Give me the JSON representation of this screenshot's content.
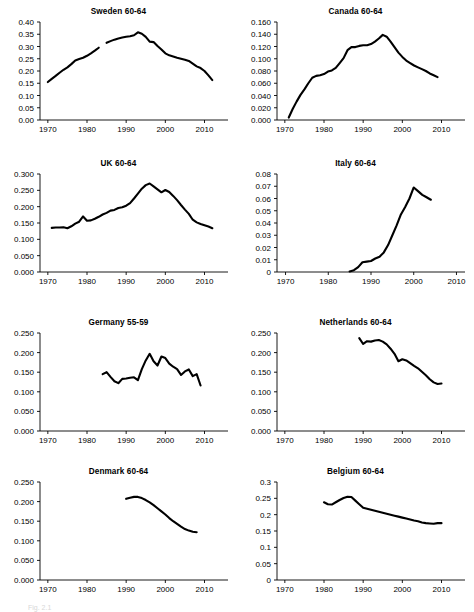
{
  "figure": {
    "title_hidden": "",
    "caption_fragment": "Fig. 2.1",
    "rows": 4,
    "cols": 2,
    "line_color": "#000000",
    "background": "#ffffff"
  },
  "chart_data": [
    {
      "type": "line",
      "title": "Sweden 60-64",
      "xlabel": "",
      "ylabel": "",
      "xlim": [
        1968,
        2016
      ],
      "ylim": [
        0.0,
        0.4
      ],
      "xticks": [
        1970,
        1980,
        1990,
        2000,
        2010
      ],
      "xtick_labels": [
        "1970",
        "1980",
        "1990",
        "2000",
        "2010"
      ],
      "yticks": [
        0.0,
        0.05,
        0.1,
        0.15,
        0.2,
        0.25,
        0.3,
        0.35,
        0.4
      ],
      "ytick_labels": [
        "0.00",
        "0.05",
        "0.10",
        "0.15",
        "0.20",
        "0.25",
        "0.30",
        "0.35",
        "0.40"
      ],
      "grid": false,
      "legend": "none",
      "segments": [
        {
          "x": [
            1970,
            1971,
            1972,
            1973,
            1974,
            1975,
            1976,
            1977,
            1978,
            1979,
            1980,
            1981,
            1982,
            1983
          ],
          "y": [
            0.155,
            0.168,
            0.18,
            0.193,
            0.205,
            0.215,
            0.228,
            0.243,
            0.249,
            0.254,
            0.262,
            0.272,
            0.283,
            0.295
          ]
        },
        {
          "x": [
            1985,
            1986,
            1987,
            1988,
            1989,
            1990,
            1991,
            1992,
            1993,
            1994,
            1995,
            1996,
            1997,
            1998,
            1999,
            2000,
            2001,
            2002,
            2003,
            2004,
            2005,
            2006,
            2007,
            2008,
            2009,
            2010,
            2011,
            2012
          ],
          "y": [
            0.315,
            0.322,
            0.328,
            0.333,
            0.337,
            0.34,
            0.342,
            0.346,
            0.358,
            0.352,
            0.339,
            0.32,
            0.318,
            0.302,
            0.288,
            0.272,
            0.264,
            0.259,
            0.254,
            0.25,
            0.246,
            0.241,
            0.23,
            0.219,
            0.212,
            0.2,
            0.182,
            0.163
          ]
        }
      ]
    },
    {
      "type": "line",
      "title": "Canada 60-64",
      "xlabel": "",
      "ylabel": "",
      "xlim": [
        1968,
        2016
      ],
      "ylim": [
        0.0,
        0.16
      ],
      "xticks": [
        1970,
        1980,
        1990,
        2000,
        2010
      ],
      "xtick_labels": [
        "1970",
        "1980",
        "1990",
        "2000",
        "2010"
      ],
      "yticks": [
        0.0,
        0.02,
        0.04,
        0.06,
        0.08,
        0.1,
        0.12,
        0.14,
        0.16
      ],
      "ytick_labels": [
        "0.000",
        "0.020",
        "0.040",
        "0.060",
        "0.080",
        "0.100",
        "0.120",
        "0.140",
        "0.160"
      ],
      "grid": false,
      "legend": "none",
      "segments": [
        {
          "x": [
            1971,
            1972,
            1973,
            1974,
            1975,
            1976,
            1977,
            1978,
            1979,
            1980,
            1981,
            1982,
            1983,
            1984,
            1985,
            1986,
            1987,
            1988,
            1989,
            1990,
            1991,
            1992,
            1993,
            1994,
            1995,
            1996,
            1997,
            1998,
            1999,
            2000,
            2001,
            2002,
            2003,
            2004,
            2005,
            2006,
            2007,
            2008,
            2009
          ],
          "y": [
            0.004,
            0.018,
            0.03,
            0.041,
            0.05,
            0.06,
            0.069,
            0.072,
            0.073,
            0.075,
            0.079,
            0.081,
            0.085,
            0.093,
            0.101,
            0.114,
            0.119,
            0.119,
            0.121,
            0.122,
            0.122,
            0.124,
            0.128,
            0.133,
            0.139,
            0.136,
            0.128,
            0.119,
            0.11,
            0.103,
            0.097,
            0.093,
            0.089,
            0.086,
            0.083,
            0.08,
            0.076,
            0.073,
            0.07
          ]
        }
      ]
    },
    {
      "type": "line",
      "title": "UK 60-64",
      "xlabel": "",
      "ylabel": "",
      "xlim": [
        1968,
        2016
      ],
      "ylim": [
        0.0,
        0.3
      ],
      "xticks": [
        1970,
        1980,
        1990,
        2000,
        2010
      ],
      "xtick_labels": [
        "1970",
        "1980",
        "1990",
        "2000",
        "2010"
      ],
      "yticks": [
        0.0,
        0.05,
        0.1,
        0.15,
        0.2,
        0.25,
        0.3
      ],
      "ytick_labels": [
        "0.000",
        "0.050",
        "0.100",
        "0.150",
        "0.200",
        "0.250",
        "0.300"
      ],
      "grid": false,
      "legend": "none",
      "segments": [
        {
          "x": [
            1971,
            1972,
            1973,
            1974,
            1975,
            1976,
            1977,
            1978,
            1979,
            1980,
            1981,
            1982,
            1983,
            1984,
            1985,
            1986,
            1987,
            1988,
            1989,
            1990,
            1991,
            1992,
            1993,
            1994,
            1995,
            1996,
            1997,
            1998,
            1999,
            2000,
            2001,
            2002,
            2003,
            2004,
            2005,
            2006,
            2007,
            2008,
            2009,
            2010,
            2011,
            2012
          ],
          "y": [
            0.135,
            0.136,
            0.136,
            0.137,
            0.134,
            0.14,
            0.148,
            0.154,
            0.17,
            0.157,
            0.158,
            0.163,
            0.169,
            0.176,
            0.181,
            0.188,
            0.19,
            0.196,
            0.198,
            0.203,
            0.211,
            0.225,
            0.24,
            0.255,
            0.266,
            0.271,
            0.262,
            0.253,
            0.244,
            0.251,
            0.245,
            0.233,
            0.22,
            0.205,
            0.191,
            0.178,
            0.16,
            0.152,
            0.147,
            0.143,
            0.139,
            0.134
          ]
        }
      ]
    },
    {
      "type": "line",
      "title": "Italy 60-64",
      "xlabel": "",
      "ylabel": "",
      "xlim": [
        1968,
        2012
      ],
      "ylim": [
        0.0,
        0.08
      ],
      "xticks": [
        1970,
        1980,
        1990,
        2000,
        2010
      ],
      "xtick_labels": [
        "1970",
        "1980",
        "1990",
        "2000",
        "2010"
      ],
      "yticks": [
        0.0,
        0.01,
        0.02,
        0.03,
        0.04,
        0.05,
        0.06,
        0.07,
        0.08
      ],
      "ytick_labels": [
        "0",
        "0.01",
        "0.02",
        "0.03",
        "0.04",
        "0.05",
        "0.06",
        "0.07",
        "0.08"
      ],
      "grid": false,
      "legend": "none",
      "segments": [
        {
          "x": [
            1985,
            1986,
            1987,
            1988,
            1989,
            1990,
            1991,
            1992,
            1993,
            1994,
            1995,
            1996,
            1997,
            1998,
            1999,
            2000,
            2001,
            2002,
            2003,
            2004
          ],
          "y": [
            0.0005,
            0.0015,
            0.004,
            0.008,
            0.0085,
            0.009,
            0.011,
            0.0125,
            0.016,
            0.022,
            0.03,
            0.038,
            0.047,
            0.053,
            0.06,
            0.069,
            0.066,
            0.063,
            0.061,
            0.059
          ]
        }
      ]
    },
    {
      "type": "line",
      "title": "Germany 55-59",
      "xlabel": "",
      "ylabel": "",
      "xlim": [
        1968,
        2016
      ],
      "ylim": [
        0.0,
        0.25
      ],
      "xticks": [
        1970,
        1980,
        1990,
        2000,
        2010
      ],
      "xtick_labels": [
        "1970",
        "1980",
        "1990",
        "2000",
        "2010"
      ],
      "yticks": [
        0.0,
        0.05,
        0.1,
        0.15,
        0.2,
        0.25
      ],
      "ytick_labels": [
        "0.000",
        "0.050",
        "0.100",
        "0.150",
        "0.200",
        "0.250"
      ],
      "grid": false,
      "legend": "none",
      "segments": [
        {
          "x": [
            1984,
            1985,
            1986,
            1987,
            1988,
            1989,
            1990,
            1991,
            1992,
            1993,
            1994,
            1995,
            1996,
            1997,
            1998,
            1999,
            2000,
            2001,
            2002,
            2003,
            2004,
            2005,
            2006,
            2007,
            2008,
            2009
          ],
          "y": [
            0.145,
            0.15,
            0.138,
            0.127,
            0.122,
            0.133,
            0.134,
            0.136,
            0.137,
            0.13,
            0.158,
            0.18,
            0.197,
            0.178,
            0.167,
            0.19,
            0.186,
            0.172,
            0.164,
            0.158,
            0.143,
            0.152,
            0.157,
            0.14,
            0.145,
            0.116
          ]
        }
      ]
    },
    {
      "type": "line",
      "title": "Netherlands 60-64",
      "xlabel": "",
      "ylabel": "",
      "xlim": [
        1968,
        2016
      ],
      "ylim": [
        0.0,
        0.25
      ],
      "xticks": [
        1970,
        1980,
        1990,
        2000,
        2010
      ],
      "xtick_labels": [
        "1970",
        "1980",
        "1990",
        "2000",
        "2010"
      ],
      "yticks": [
        0.0,
        0.05,
        0.1,
        0.15,
        0.2,
        0.25
      ],
      "ytick_labels": [
        "0.000",
        "0.050",
        "0.100",
        "0.150",
        "0.200",
        "0.250"
      ],
      "grid": false,
      "legend": "none",
      "segments": [
        {
          "x": [
            1989,
            1990,
            1991,
            1992,
            1993,
            1994,
            1995,
            1996,
            1997,
            1998,
            1999,
            2000,
            2001,
            2002,
            2003,
            2004,
            2005,
            2006,
            2007,
            2008,
            2009,
            2010
          ],
          "y": [
            0.237,
            0.222,
            0.229,
            0.228,
            0.231,
            0.232,
            0.228,
            0.221,
            0.21,
            0.197,
            0.178,
            0.183,
            0.18,
            0.173,
            0.166,
            0.16,
            0.151,
            0.142,
            0.132,
            0.124,
            0.12,
            0.121
          ]
        }
      ]
    },
    {
      "type": "line",
      "title": "Denmark 60-64",
      "xlabel": "",
      "ylabel": "",
      "xlim": [
        1968,
        2016
      ],
      "ylim": [
        0.0,
        0.25
      ],
      "xticks": [
        1970,
        1980,
        1990,
        2000,
        2010
      ],
      "xtick_labels": [
        "1970",
        "1980",
        "1990",
        "2000",
        "2010"
      ],
      "yticks": [
        0.0,
        0.05,
        0.1,
        0.15,
        0.2,
        0.25
      ],
      "ytick_labels": [
        "0.000",
        "0.050",
        "0.100",
        "0.150",
        "0.200",
        "0.250"
      ],
      "grid": false,
      "legend": "none",
      "segments": [
        {
          "x": [
            1990,
            1991,
            1992,
            1993,
            1994,
            1995,
            1996,
            1997,
            1998,
            1999,
            2000,
            2001,
            2002,
            2003,
            2004,
            2005,
            2006,
            2007,
            2008
          ],
          "y": [
            0.207,
            0.21,
            0.212,
            0.212,
            0.209,
            0.204,
            0.198,
            0.191,
            0.183,
            0.175,
            0.167,
            0.158,
            0.15,
            0.143,
            0.136,
            0.13,
            0.126,
            0.123,
            0.122
          ]
        }
      ]
    },
    {
      "type": "line",
      "title": "Belgium 60-64",
      "xlabel": "",
      "ylabel": "",
      "xlim": [
        1968,
        2016
      ],
      "ylim": [
        0.0,
        0.3
      ],
      "xticks": [
        1970,
        1980,
        1990,
        2000,
        2010
      ],
      "xtick_labels": [
        "1970",
        "1980",
        "1990",
        "2000",
        "2010"
      ],
      "yticks": [
        0.0,
        0.05,
        0.1,
        0.15,
        0.2,
        0.25,
        0.3
      ],
      "ytick_labels": [
        "0",
        "0.05",
        "0.1",
        "0.15",
        "0.2",
        "0.25",
        "0.3"
      ],
      "grid": false,
      "legend": "none",
      "segments": [
        {
          "x": [
            1980,
            1981,
            1982,
            1983,
            1984,
            1985,
            1986,
            1987,
            1988,
            1989,
            1990,
            1991,
            1992,
            1993,
            1994,
            1995,
            1996,
            1997,
            1998,
            1999,
            2000,
            2001,
            2002,
            2003,
            2004,
            2005,
            2006,
            2007,
            2008,
            2009,
            2010
          ],
          "y": [
            0.238,
            0.232,
            0.231,
            0.238,
            0.245,
            0.251,
            0.255,
            0.254,
            0.243,
            0.232,
            0.221,
            0.218,
            0.215,
            0.212,
            0.209,
            0.206,
            0.203,
            0.2,
            0.197,
            0.194,
            0.191,
            0.188,
            0.185,
            0.182,
            0.18,
            0.176,
            0.174,
            0.173,
            0.172,
            0.174,
            0.174
          ]
        }
      ]
    }
  ]
}
